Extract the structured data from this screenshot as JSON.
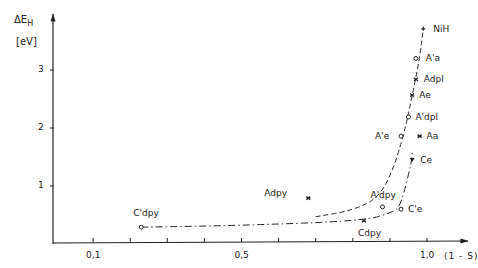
{
  "chart_data": {
    "type": "scatter",
    "title": "",
    "ylabel": "ΔE_H",
    "ylabel_unit": "[eV]",
    "xlabel": "(1 - S)",
    "xlim": [
      0,
      1.08
    ],
    "ylim": [
      0,
      4
    ],
    "x_ticks": [
      0.1,
      0.2,
      0.3,
      0.4,
      0.5,
      0.6,
      0.7,
      0.8,
      0.9,
      1.0
    ],
    "x_tick_labels": [
      {
        "value": 0.1,
        "label": "0,1"
      },
      {
        "value": 0.5,
        "label": "0,5"
      },
      {
        "value": 1.0,
        "label": "1,0"
      }
    ],
    "y_ticks": [
      {
        "value": 1,
        "label": "1"
      },
      {
        "value": 2,
        "label": "2"
      },
      {
        "value": 3,
        "label": "3"
      }
    ],
    "grid": false,
    "legend": "none (points labelled directly)",
    "points": [
      {
        "label": "NiH",
        "x": 0.99,
        "y": 3.71,
        "marker": "plus"
      },
      {
        "label": "A'a",
        "x": 0.97,
        "y": 3.2,
        "marker": "open-circle"
      },
      {
        "label": "Adpl",
        "x": 0.97,
        "y": 2.84,
        "marker": "x"
      },
      {
        "label": "Ae",
        "x": 0.96,
        "y": 2.57,
        "marker": "x"
      },
      {
        "label": "A'dpl",
        "x": 0.95,
        "y": 2.19,
        "marker": "open-circle"
      },
      {
        "label": "A'e",
        "x": 0.93,
        "y": 1.86,
        "marker": "open-circle"
      },
      {
        "label": "Aa",
        "x": 0.98,
        "y": 1.86,
        "marker": "x"
      },
      {
        "label": "Ce",
        "x": 0.96,
        "y": 1.45,
        "marker": "filled"
      },
      {
        "label": "A'dpy",
        "x": 0.88,
        "y": 0.64,
        "marker": "open-circle"
      },
      {
        "label": "C'e",
        "x": 0.93,
        "y": 0.6,
        "marker": "open-circle"
      },
      {
        "label": "Cdpy",
        "x": 0.83,
        "y": 0.4,
        "marker": "x"
      },
      {
        "label": "Adpy",
        "x": 0.68,
        "y": 0.79,
        "marker": "x"
      },
      {
        "label": "C'dpy",
        "x": 0.23,
        "y": 0.29,
        "marker": "open-circle"
      }
    ],
    "series": [
      {
        "name": "A-series trend (dashed)",
        "style": "dashed",
        "x": [
          0.7,
          0.8,
          0.87,
          0.91,
          0.94,
          0.96,
          0.98,
          0.99
        ],
        "y": [
          0.47,
          0.58,
          0.8,
          1.3,
          1.95,
          2.55,
          3.2,
          3.71
        ]
      },
      {
        "name": "C-series trend (dash-dot)",
        "style": "dash-dot",
        "x": [
          0.23,
          0.5,
          0.83,
          0.91,
          0.93,
          0.96,
          0.96
        ],
        "y": [
          0.29,
          0.32,
          0.4,
          0.55,
          0.68,
          1.45,
          1.62
        ]
      }
    ]
  },
  "axes": {
    "y_title": "ΔE",
    "y_title_sub": "H",
    "y_unit": "[eV]",
    "x_title": "(1 - S)"
  }
}
